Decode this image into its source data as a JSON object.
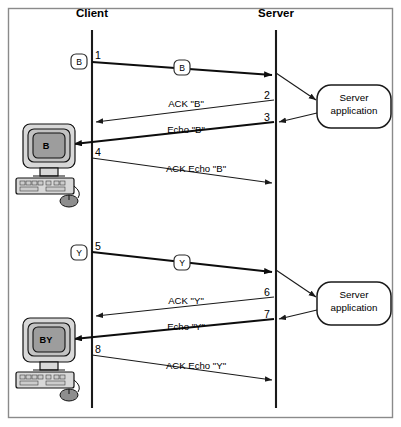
{
  "diagram": {
    "title_client": "Client",
    "title_server": "Server",
    "server_app_line1": "Server",
    "server_app_line2": "application",
    "client_screen_top": "B",
    "client_screen_bottom": "BY",
    "token_b": "B",
    "token_y": "Y",
    "token_b_inflight": "B",
    "token_y_inflight": "Y",
    "steps": [
      {
        "num": "1",
        "label": "B",
        "from": "client",
        "to": "server"
      },
      {
        "num": "2",
        "label": "ACK \"B\"",
        "from": "server",
        "to": "client"
      },
      {
        "num": "3",
        "label": "Echo \"B\"",
        "from": "server",
        "to": "client"
      },
      {
        "num": "4",
        "label": "ACK Echo \"B\"",
        "from": "client",
        "to": "server"
      },
      {
        "num": "5",
        "label": "Y",
        "from": "client",
        "to": "server"
      },
      {
        "num": "6",
        "label": "ACK \"Y\"",
        "from": "server",
        "to": "client"
      },
      {
        "num": "7",
        "label": "Echo \"Y\"",
        "from": "server",
        "to": "client"
      },
      {
        "num": "8",
        "label": "ACK Echo \"Y\"",
        "from": "client",
        "to": "server"
      }
    ],
    "numbers": [
      "1",
      "2",
      "3",
      "4",
      "5",
      "6",
      "7",
      "8"
    ],
    "colors": {
      "frame": "#8a8a8a",
      "line": "#1a1a1a",
      "background": "#ffffff",
      "screen": "#9d9d9d",
      "case": "#d8d8d8"
    }
  }
}
